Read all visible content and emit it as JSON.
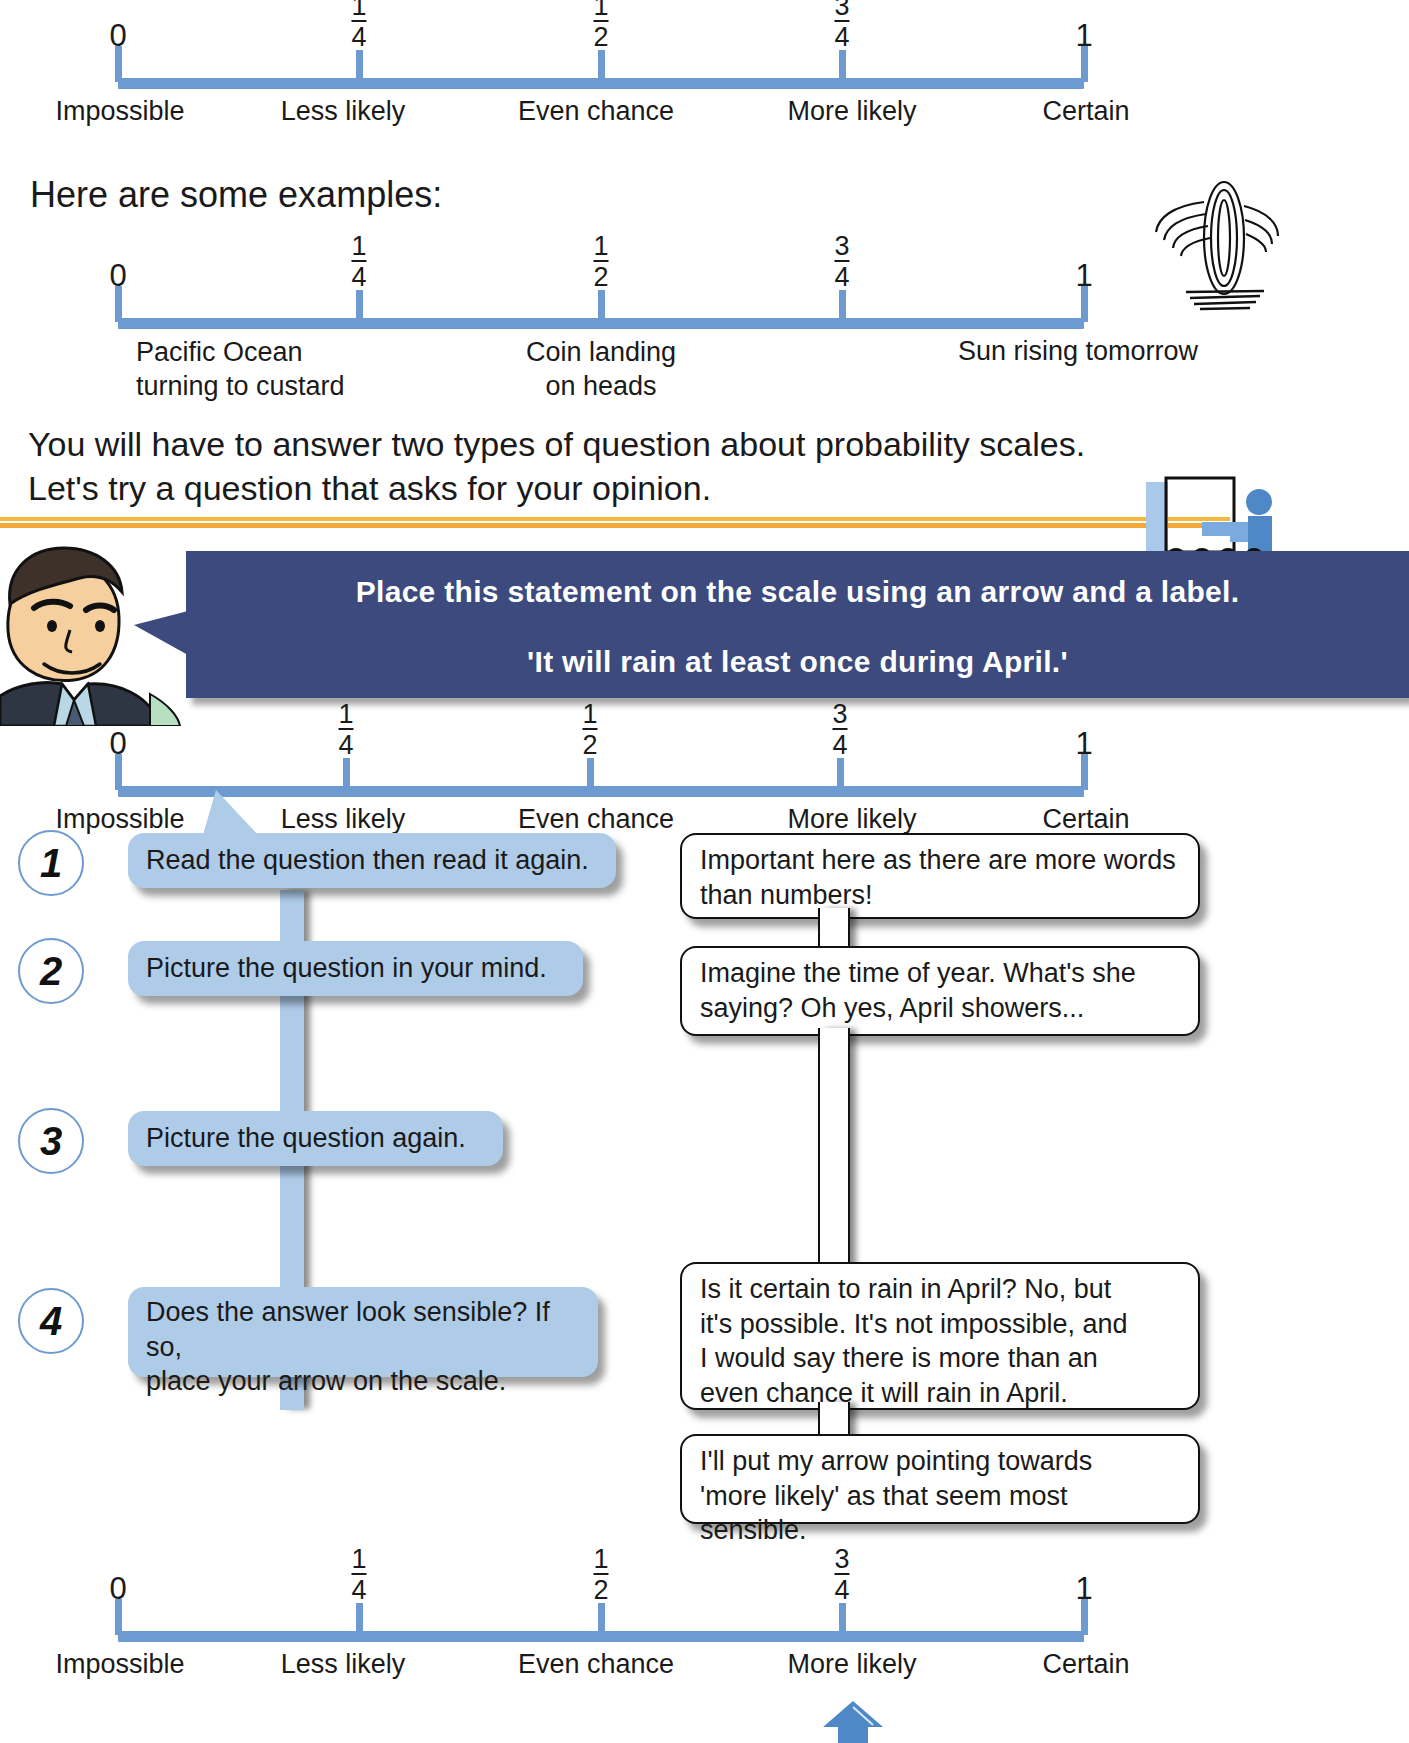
{
  "page": {
    "scale_labels": [
      "Impossible",
      "Less likely",
      "Even chance",
      "More likely",
      "Certain"
    ],
    "scale_numbers": [
      "0",
      "1/4",
      "1/2",
      "3/4",
      "1"
    ],
    "accent_blue": "#6d9bd1",
    "bubble_blue": "#aecbe8",
    "banner_navy": "#3c4a7d",
    "rule_orange": "#f4a93a"
  },
  "scale_top": {
    "numerators": [
      "1",
      "1",
      "3"
    ],
    "denominators": [
      "4",
      "2",
      "4"
    ],
    "zero": "0",
    "one": "1",
    "labels": [
      "Impossible",
      "Less likely",
      "Even chance",
      "More likely",
      "Certain"
    ]
  },
  "examples_heading": "Here are some examples:",
  "scale_examples": {
    "zero": "0",
    "one": "1",
    "numerators": [
      "1",
      "1",
      "3"
    ],
    "denominators": [
      "4",
      "2",
      "4"
    ],
    "label_left_line1": "Pacific Ocean",
    "label_left_line2": "turning to custard",
    "label_mid_line1": "Coin landing",
    "label_mid_line2": "on heads",
    "label_right": "Sun rising tomorrow"
  },
  "intro_paragraph": "You will have to answer two types of question about probability scales.\nLet's try a question that asks for your opinion.",
  "banner": {
    "line1": "Place this statement on the scale using an arrow and a label.",
    "line2": "'It will rain at least once during April.'"
  },
  "scale_question": {
    "zero": "0",
    "one": "1",
    "numerators": [
      "1",
      "1",
      "3"
    ],
    "denominators": [
      "4",
      "2",
      "4"
    ],
    "labels": [
      "Impossible",
      "Less likely",
      "Even chance",
      "More likely",
      "Certain"
    ]
  },
  "steps": [
    {
      "number": "1",
      "action": "Read the question then read it again.",
      "thought": "Important here as there are more words\nthan numbers!"
    },
    {
      "number": "2",
      "action": "Picture the question in your mind.",
      "thought": "Imagine the time of year. What's she\nsaying? Oh yes, April showers..."
    },
    {
      "number": "3",
      "action": "Picture the question again.",
      "thought": "Is it certain to rain in April? No, but\nit's possible. It's not impossible, and\nI would say there is more than an\neven chance it will rain in April."
    },
    {
      "number": "4",
      "action": "Does the answer look sensible? If so,\nplace your arrow on the scale.",
      "thought": "I'll put my arrow pointing towards\n'more likely' as that seem most sensible."
    }
  ],
  "scale_answer": {
    "zero": "0",
    "one": "1",
    "numerators": [
      "1",
      "1",
      "3"
    ],
    "denominators": [
      "4",
      "2",
      "4"
    ],
    "labels": [
      "Impossible",
      "Less likely",
      "Even chance",
      "More likely",
      "Certain"
    ],
    "arrow_points_at": "More likely"
  }
}
